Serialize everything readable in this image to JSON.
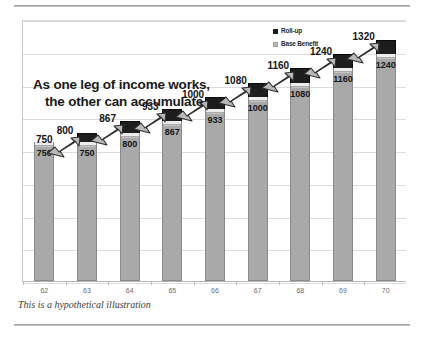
{
  "headline": {
    "line1": "As one leg of income works,",
    "line2": "the other can accumulate"
  },
  "caption": "This is a hypothetical illustration",
  "legend": {
    "rollup_label": "Roll-up",
    "base_label": "Base Benefit"
  },
  "colors": {
    "rollup": "#1d1d1d",
    "base": "#a9a9a9",
    "gap": "#ececec",
    "gridline": "#dcdcdc",
    "text": "#141414",
    "caption": "#3d3d3d"
  },
  "chart_data": {
    "type": "bar",
    "title": "As one leg of income works, the other can accumulate",
    "subtitle": "This is a hypothetical illustration",
    "xlabel": "",
    "ylabel": "",
    "categories": [
      "62",
      "63",
      "64",
      "65",
      "66",
      "67",
      "68",
      "69",
      "70"
    ],
    "ylim": [
      0,
      1450
    ],
    "grid": true,
    "stacked": true,
    "legend_position": "top-right",
    "series": [
      {
        "name": "Base Benefit",
        "values": [
          750,
          750,
          800,
          867,
          933,
          1000,
          1080,
          1160,
          1240
        ]
      },
      {
        "name": "Roll-up",
        "values": [
          0,
          50,
          67,
          66,
          67,
          80,
          80,
          80,
          80
        ]
      }
    ],
    "totals": [
      750,
      800,
      867,
      933,
      1000,
      1080,
      1160,
      1240,
      1320
    ],
    "base_labels": [
      "750",
      "750",
      "800",
      "867",
      "933",
      "1000",
      "1080",
      "1160",
      "1240"
    ],
    "total_labels": [
      "750",
      "800",
      "867",
      "933",
      "1000",
      "1080",
      "1160",
      "1240",
      "1320"
    ],
    "annotations": [
      {
        "type": "arrow",
        "from": "62",
        "to": "63",
        "note": "roll-up accumulates"
      },
      {
        "type": "arrow",
        "from": "63",
        "to": "64",
        "note": "roll-up accumulates"
      },
      {
        "type": "arrow",
        "from": "64",
        "to": "65",
        "note": "roll-up accumulates"
      },
      {
        "type": "arrow",
        "from": "65",
        "to": "66",
        "note": "roll-up accumulates"
      },
      {
        "type": "arrow",
        "from": "66",
        "to": "67",
        "note": "roll-up accumulates"
      },
      {
        "type": "arrow",
        "from": "67",
        "to": "68",
        "note": "roll-up accumulates"
      },
      {
        "type": "arrow",
        "from": "68",
        "to": "69",
        "note": "roll-up accumulates"
      },
      {
        "type": "arrow",
        "from": "69",
        "to": "70",
        "note": "roll-up accumulates"
      }
    ]
  }
}
